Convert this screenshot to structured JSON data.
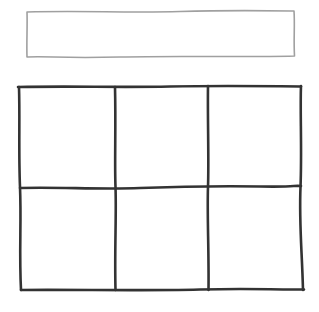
{
  "wireframe": {
    "style": "hand-drawn sketch",
    "input_box": {
      "value": "",
      "placeholder": "",
      "stroke_color": "#a0a0a0"
    },
    "grid": {
      "rows": 2,
      "columns": 3,
      "stroke_color": "#333333",
      "cells": [
        {
          "row": 1,
          "col": 1,
          "content": ""
        },
        {
          "row": 1,
          "col": 2,
          "content": ""
        },
        {
          "row": 1,
          "col": 3,
          "content": ""
        },
        {
          "row": 2,
          "col": 1,
          "content": ""
        },
        {
          "row": 2,
          "col": 2,
          "content": ""
        },
        {
          "row": 2,
          "col": 3,
          "content": ""
        }
      ]
    }
  }
}
